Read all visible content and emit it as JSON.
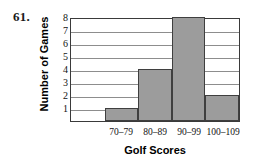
{
  "problem": {
    "number": "61."
  },
  "chart_data": {
    "type": "bar",
    "title": "",
    "xlabel": "Golf Scores",
    "ylabel": "Number of Games",
    "categories": [
      "",
      "70–79",
      "80–89",
      "90–99",
      "100–109"
    ],
    "values": [
      0,
      1,
      4,
      8,
      2
    ],
    "bars": [
      {
        "category": "",
        "value": 0
      },
      {
        "category": "70–79",
        "value": 1
      },
      {
        "category": "80–89",
        "value": 4
      },
      {
        "category": "90–99",
        "value": 8
      },
      {
        "category": "100–109",
        "value": 2
      }
    ],
    "ylim": [
      0,
      8
    ],
    "yticks": [
      "8",
      "7",
      "6",
      "5",
      "4",
      "3",
      "2",
      "1"
    ],
    "ytick_values": [
      8,
      7,
      6,
      5,
      4,
      3,
      2,
      1
    ],
    "grid": true,
    "grid_axis": "y",
    "legend": false,
    "bar_color": "#9c9c9c",
    "bar_edge_color": "#3f3f3f",
    "frame_color": "#3a3a3a",
    "grid_color": "#8d8d8d"
  }
}
